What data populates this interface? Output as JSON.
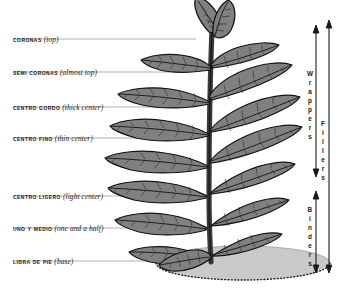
{
  "figure": {
    "background_color": "#ffffff",
    "leaf_fill": "#808080",
    "leaf_outline": "#121212",
    "vein_color": "#2b2b2b",
    "ground_fill": "#c9c9c9",
    "stem_color": "#3a3a3a",
    "leader_line_color": "#a8a8a8",
    "text_color": "#1a1a1a"
  },
  "left_labels": [
    {
      "term": "Coronas",
      "gloss": "(top)",
      "y": 33,
      "line_y": 39,
      "line_end_x": 196
    },
    {
      "term": "Semi Coronas",
      "gloss": "(almost top)",
      "y": 66,
      "line_y": 72,
      "line_end_x": 190
    },
    {
      "term": "Centro Gordo",
      "gloss": "(thick center)",
      "y": 101,
      "line_y": 107,
      "line_end_x": 186
    },
    {
      "term": "Centro Fino",
      "gloss": "(thin center)",
      "y": 132,
      "line_y": 138,
      "line_end_x": 182
    },
    {
      "term": "Centro Ligero",
      "gloss": "(light center)",
      "y": 190,
      "line_y": 196,
      "line_end_x": 178
    },
    {
      "term": "Uno y Medio",
      "gloss": "(one and a half)",
      "y": 222,
      "line_y": 228,
      "line_end_x": 176
    },
    {
      "term": "Libra de Pie",
      "gloss": "(base)",
      "y": 255,
      "line_y": 261,
      "line_end_x": 174
    }
  ],
  "right_brackets": [
    {
      "label": "Wrappers",
      "axis_x": 316,
      "top_y": 26,
      "bottom_y": 176,
      "text_center_y": 101
    },
    {
      "label": "Binders",
      "axis_x": 316,
      "top_y": 192,
      "bottom_y": 272,
      "text_center_y": 232
    },
    {
      "label": "Fillers",
      "axis_x": 329,
      "top_y": 21,
      "bottom_y": 272,
      "text_center_y": 148
    }
  ]
}
